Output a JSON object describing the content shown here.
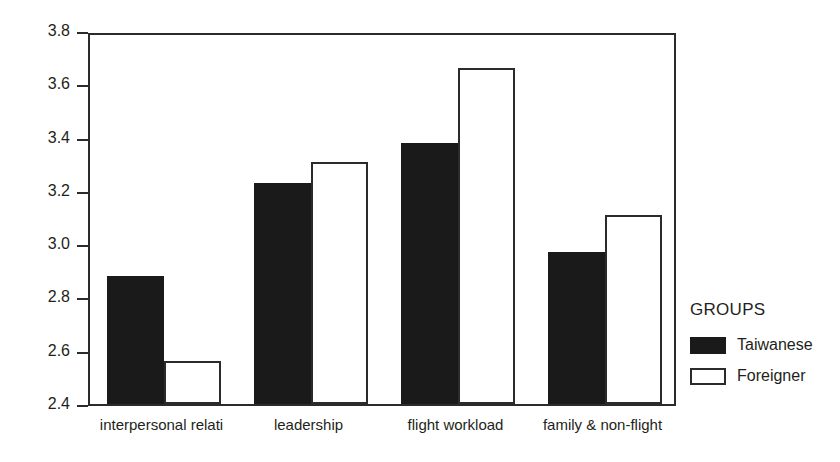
{
  "chart_data": {
    "type": "bar",
    "title": "",
    "subtitle": "",
    "xlabel": "",
    "ylabel": "",
    "ylim": [
      2.4,
      3.8
    ],
    "yticks": [
      "2.4",
      "2.6",
      "2.8",
      "3.0",
      "3.2",
      "3.4",
      "3.6",
      "3.8"
    ],
    "grid": false,
    "legend_position": "right",
    "legend_title": "GROUPS",
    "categories": [
      "interpersonal relati",
      "leadership",
      "flight workload",
      "family & non-flight"
    ],
    "series": [
      {
        "name": "Taiwanese",
        "color": "#1a1a1a",
        "values": [
          2.88,
          3.23,
          3.38,
          2.97
        ]
      },
      {
        "name": "Foreigner",
        "color": "#ffffff",
        "values": [
          2.56,
          3.31,
          3.66,
          3.11
        ]
      }
    ]
  },
  "legend": {
    "title": "GROUPS",
    "entries": [
      {
        "label": "Taiwanese",
        "swatch": "filled-black-swatch"
      },
      {
        "label": "Foreigner",
        "swatch": "outlined-white-swatch"
      }
    ]
  }
}
